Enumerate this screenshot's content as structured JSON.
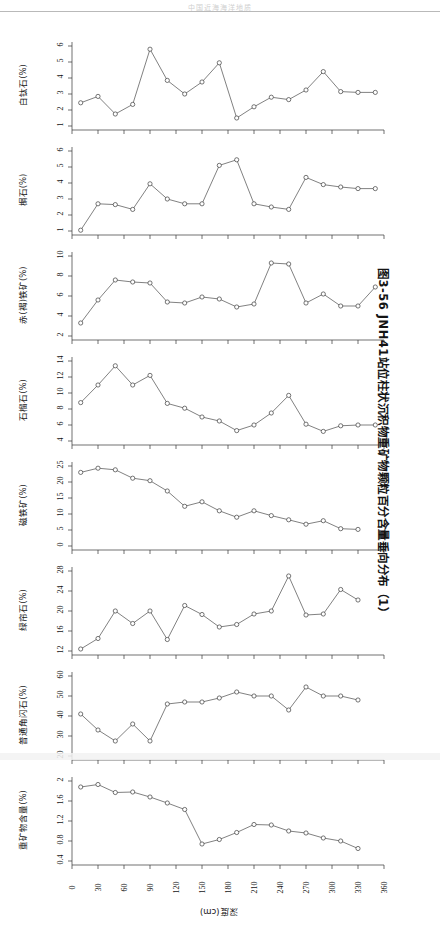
{
  "running_head": "中国近海海洋地质",
  "caption": "图3-56  JNH41站位柱状沉积物重矿物颗粒百分含量垂向分布（1）",
  "xaxis": {
    "label": "深度(cm)",
    "ticks": [
      "0",
      "30",
      "60",
      "90",
      "120",
      "150",
      "180",
      "210",
      "240",
      "270",
      "300",
      "330",
      "360"
    ],
    "min": 0,
    "max": 360
  },
  "chart_data": [
    {
      "type": "line",
      "title": "白钛石(%)",
      "ylabel": "白钛石(%)",
      "xlabel": "深度(cm)",
      "ylim": [
        1,
        6
      ],
      "yticks": [
        "1",
        "2",
        "3",
        "4",
        "5",
        "6"
      ],
      "x": [
        10,
        30,
        50,
        70,
        90,
        110,
        130,
        150,
        170,
        190,
        210,
        230,
        250,
        270,
        290,
        310,
        330,
        350
      ],
      "values": [
        2.45,
        2.85,
        1.75,
        2.35,
        5.8,
        3.85,
        3.0,
        3.75,
        4.95,
        1.5,
        2.2,
        2.8,
        2.65,
        3.25,
        4.4,
        3.15,
        3.1,
        3.1
      ],
      "grid": false,
      "legend": "none"
    },
    {
      "type": "line",
      "title": "榍石(%)",
      "ylabel": "榍石(%)",
      "xlabel": "深度(cm)",
      "ylim": [
        1,
        6
      ],
      "yticks": [
        "1",
        "2",
        "3",
        "4",
        "5",
        "6"
      ],
      "x": [
        10,
        30,
        50,
        70,
        90,
        110,
        130,
        150,
        170,
        190,
        210,
        230,
        250,
        270,
        290,
        310,
        330,
        350
      ],
      "values": [
        1.05,
        2.7,
        2.65,
        2.35,
        3.95,
        3.0,
        2.7,
        2.7,
        5.1,
        5.45,
        2.7,
        2.5,
        2.35,
        4.35,
        3.9,
        3.75,
        3.65,
        3.65
      ],
      "grid": false,
      "legend": "none"
    },
    {
      "type": "line",
      "title": "赤(褐)铁矿(%)",
      "ylabel": "赤(褐)铁矿(%)",
      "xlabel": "深度(cm)",
      "ylim": [
        2,
        10
      ],
      "yticks": [
        "2",
        "4",
        "6",
        "8",
        "10"
      ],
      "x": [
        10,
        30,
        50,
        70,
        90,
        110,
        130,
        150,
        170,
        190,
        210,
        230,
        250,
        270,
        290,
        310,
        330,
        350
      ],
      "values": [
        3.3,
        5.6,
        7.6,
        7.4,
        7.3,
        5.4,
        5.3,
        5.9,
        5.7,
        4.9,
        5.2,
        9.3,
        9.2,
        5.3,
        6.2,
        5.0,
        5.0,
        6.9
      ],
      "grid": false,
      "legend": "none"
    },
    {
      "type": "line",
      "title": "石榴石(%)",
      "ylabel": "石榴石(%)",
      "xlabel": "深度(cm)",
      "ylim": [
        4,
        14
      ],
      "yticks": [
        "4",
        "6",
        "8",
        "10",
        "12",
        "14"
      ],
      "x": [
        10,
        30,
        50,
        70,
        90,
        110,
        130,
        150,
        170,
        190,
        210,
        230,
        250,
        270,
        290,
        310,
        330,
        350
      ],
      "values": [
        8.8,
        11.0,
        13.4,
        11.0,
        12.2,
        8.7,
        8.1,
        7.0,
        6.5,
        5.3,
        6.0,
        7.5,
        9.7,
        6.1,
        5.2,
        5.9,
        6.0,
        6.0
      ],
      "grid": false,
      "legend": "none"
    },
    {
      "type": "line",
      "title": "磁铁矿(%)",
      "ylabel": "磁铁矿(%)",
      "xlabel": "深度(cm)",
      "ylim": [
        0,
        25
      ],
      "yticks": [
        "0",
        "5",
        "10",
        "15",
        "20",
        "25"
      ],
      "x": [
        10,
        30,
        50,
        70,
        90,
        110,
        130,
        150,
        170,
        190,
        210,
        230,
        250,
        270,
        290,
        310,
        330,
        350
      ],
      "values": [
        23.0,
        24.3,
        23.8,
        21.2,
        20.4,
        17.2,
        12.4,
        13.8,
        11.0,
        9.0,
        11.0,
        9.5,
        8.2,
        6.8,
        7.9,
        5.4,
        5.2
      ],
      "grid": false,
      "legend": "none"
    },
    {
      "type": "line",
      "title": "绿帘石(%)",
      "ylabel": "绿帘石(%)",
      "xlabel": "深度(cm)",
      "ylim": [
        12,
        28
      ],
      "yticks": [
        "12",
        "16",
        "20",
        "24",
        "28"
      ],
      "x": [
        10,
        30,
        50,
        70,
        90,
        110,
        130,
        150,
        170,
        190,
        210,
        230,
        250,
        270,
        290,
        310,
        330,
        350
      ],
      "values": [
        12.4,
        14.5,
        20.0,
        17.5,
        20.0,
        14.3,
        21.1,
        19.3,
        16.8,
        17.3,
        19.4,
        20.0,
        27.0,
        19.2,
        19.4,
        24.3,
        22.2
      ],
      "grid": false,
      "legend": "none"
    },
    {
      "type": "line",
      "title": "普通角闪石(%)",
      "ylabel": "普通角闪石(%)",
      "xlabel": "深度(cm)",
      "ylim": [
        20,
        60
      ],
      "yticks": [
        "20",
        "30",
        "40",
        "50",
        "60"
      ],
      "x": [
        10,
        30,
        50,
        70,
        90,
        110,
        130,
        150,
        170,
        190,
        210,
        230,
        250,
        270,
        290,
        310,
        330,
        350
      ],
      "values": [
        41.0,
        33.0,
        27.5,
        36.0,
        27.5,
        46.0,
        47.0,
        47.0,
        49.0,
        52.0,
        50.0,
        50.0,
        43.0,
        54.5,
        50.0,
        50.0,
        48.0
      ],
      "grid": false,
      "legend": "none"
    },
    {
      "type": "line",
      "title": "重矿物含量(%)",
      "ylabel": "重矿物含量(%)",
      "xlabel": "深度(cm)",
      "ylim": [
        0.4,
        2.0
      ],
      "yticks": [
        "0.4",
        "0.8",
        "1.2",
        "1.6",
        "2"
      ],
      "x": [
        10,
        30,
        50,
        70,
        90,
        110,
        130,
        150,
        170,
        190,
        210,
        230,
        250,
        270,
        290,
        310,
        330,
        350
      ],
      "values": [
        1.88,
        1.93,
        1.77,
        1.78,
        1.68,
        1.56,
        1.43,
        0.74,
        0.83,
        0.97,
        1.13,
        1.12,
        1.0,
        0.96,
        0.86,
        0.8,
        0.65
      ],
      "grid": false,
      "legend": "none"
    }
  ]
}
